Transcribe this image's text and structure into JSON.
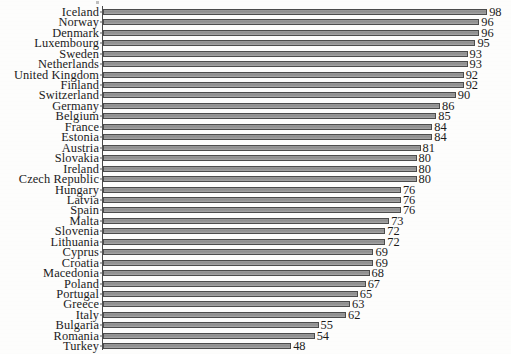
{
  "chart_data": {
    "type": "bar",
    "orientation": "horizontal",
    "title": "",
    "subtitle": "",
    "xlabel": "",
    "ylabel": "",
    "xlim": [
      0,
      100
    ],
    "grid": false,
    "legend": null,
    "data_labels": true,
    "categories": [
      "Iceland",
      "Norway",
      "Denmark",
      "Luxembourg",
      "Sweden",
      "Netherlands",
      "United Kingdom",
      "Finland",
      "Switzerland",
      "Germany",
      "Belgium",
      "France",
      "Estonia",
      "Austria",
      "Slovakia",
      "Ireland",
      "Czech Republic",
      "Hungary",
      "Latvia",
      "Spain",
      "Malta",
      "Slovenia",
      "Lithuania",
      "Cyprus",
      "Croatia",
      "Macedonia",
      "Poland",
      "Portugal",
      "Greece",
      "Italy",
      "Bulgaria",
      "Romania",
      "Turkey"
    ],
    "values": [
      98,
      96,
      96,
      95,
      93,
      93,
      92,
      92,
      90,
      86,
      85,
      84,
      84,
      81,
      80,
      80,
      80,
      76,
      76,
      76,
      73,
      72,
      72,
      69,
      69,
      68,
      67,
      65,
      63,
      62,
      55,
      54,
      48
    ],
    "colors": {
      "bar_fill": "#999999",
      "bar_edge": "#4c4c4c",
      "text": "#1b1b1b",
      "axis": "#4a4a4a",
      "background": "#fdfdfc"
    }
  }
}
